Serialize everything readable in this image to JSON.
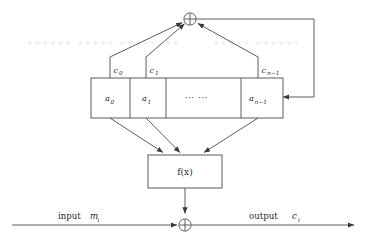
{
  "figure": {
    "background_color": "#ffffff",
    "line_color": "#4a4a4a",
    "text_color": "#2b2b2b"
  },
  "register": {
    "name": "shift-register",
    "cells": [
      {
        "label": "a",
        "subscript": "0"
      },
      {
        "label": "a",
        "subscript": "1"
      },
      {
        "label": "···  ···",
        "subscript": ""
      },
      {
        "label": "a",
        "subscript": "n−1"
      }
    ]
  },
  "taps": [
    {
      "label": "c",
      "subscript": "0"
    },
    {
      "label": "c",
      "subscript": "1"
    },
    {
      "label": "c",
      "subscript": "n−1"
    }
  ],
  "nodes": {
    "feedback_adder": {
      "glyph": "⊕",
      "name": "xor"
    },
    "output_adder": {
      "glyph": "⊕",
      "name": "xor"
    }
  },
  "function_box": {
    "label": "f(x)"
  },
  "io": {
    "input_text": "input",
    "input_var": "m",
    "input_sub": "i",
    "output_text": "output",
    "output_var": "c",
    "output_sub": "i"
  }
}
